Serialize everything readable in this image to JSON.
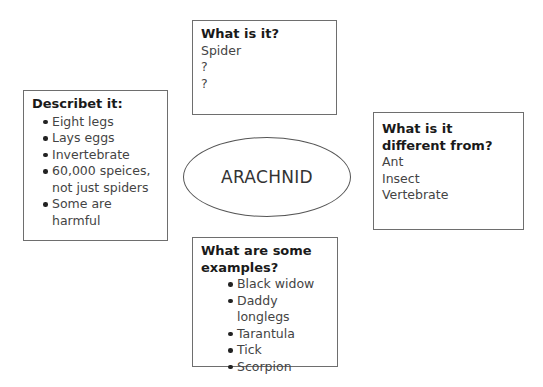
{
  "center": {
    "label": "ARACHNID"
  },
  "what_is_it": {
    "title": "What is it?",
    "items": [
      "Spider",
      "?",
      "?"
    ]
  },
  "describe_it": {
    "title": "Describet it:",
    "items": [
      "Eight legs",
      "Lays eggs",
      "Invertebrate",
      "60,000 speices, not just spiders",
      "Some are harmful"
    ]
  },
  "different_from": {
    "title": "What is it different from?",
    "items": [
      "Ant",
      "Insect",
      "Vertebrate"
    ]
  },
  "examples": {
    "title": "What are some examples?",
    "items": [
      "Black widow",
      "Daddy longlegs",
      "Tarantula",
      "Tick",
      "Scorpion"
    ]
  },
  "colors": {
    "border": "#6e6e6e",
    "text": "#333333",
    "heading": "#1a1a1a"
  }
}
